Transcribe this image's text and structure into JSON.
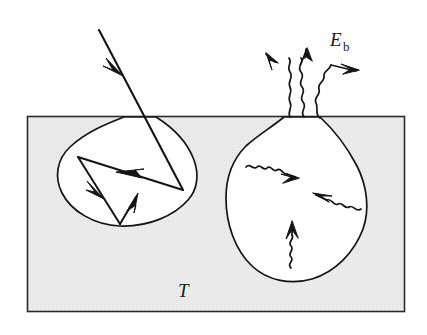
{
  "figure": {
    "type": "schematic-diagram",
    "canvas": {
      "width": 427,
      "height": 335,
      "background": "#ffffff"
    }
  },
  "labels": {
    "emissive_power": {
      "base": "E",
      "subscript": "b",
      "full": "E_b",
      "x": 330,
      "y": 44
    },
    "temperature": {
      "text": "T",
      "x": 182,
      "y": 293
    }
  },
  "colors": {
    "solid_fill": "#e9e9e9",
    "solid_fill_alt": "#efefef",
    "stroke": "#141414",
    "cavity_fill": "#ffffff",
    "border": "#2b2b2b",
    "text": "#1a1a1a"
  },
  "solid_block": {
    "name": "solid-material",
    "x": 27,
    "y": 116,
    "width": 378,
    "height": 196,
    "surface_y": 116
  },
  "left_cavity": {
    "name": "specular-reflection-cavity",
    "description": "Pit with multiple internal specular reflections of an incident ray",
    "opening_left_x": 124,
    "opening_right_x": 156,
    "max_depth_y": 226,
    "leftmost_x": 57,
    "rightmost_x": 196
  },
  "incident_ray": {
    "name": "incident-ray",
    "from": {
      "x": 99,
      "y": 30
    },
    "to": {
      "x": 183,
      "y": 190
    },
    "arrowhead_at": {
      "x": 118,
      "y": 67
    },
    "style": "straight-solid"
  },
  "reflected_rays": [
    {
      "name": "reflection-1",
      "from": {
        "x": 183,
        "y": 190
      },
      "to": {
        "x": 78,
        "y": 157
      },
      "arrow_t": 0.55
    },
    {
      "name": "reflection-2",
      "from": {
        "x": 78,
        "y": 157
      },
      "to": {
        "x": 120,
        "y": 224
      },
      "arrow_t": 0.52
    },
    {
      "name": "reflection-3",
      "from": {
        "x": 120,
        "y": 224
      },
      "to": {
        "x": 137,
        "y": 196
      },
      "arrow_t": 1.0
    }
  ],
  "right_cavity": {
    "name": "emission-cavity",
    "description": "Egg-shaped cavity with narrow neck emitting blackbody radiation",
    "neck_left_x": 284,
    "neck_right_x": 320,
    "neck_y": 116,
    "bottom_y": 281,
    "leftmost_x": 226,
    "rightmost_x": 366
  },
  "emitted_rays": [
    {
      "name": "emitted-ray-left",
      "tip": {
        "x": 266,
        "y": 54
      },
      "origin": {
        "x": 290,
        "y": 116
      },
      "direction": "up-left"
    },
    {
      "name": "emitted-ray-center",
      "tip": {
        "x": 307,
        "y": 50
      },
      "origin": {
        "x": 303,
        "y": 116
      },
      "direction": "up"
    },
    {
      "name": "emitted-ray-right",
      "tip": {
        "x": 358,
        "y": 70
      },
      "origin": {
        "x": 320,
        "y": 118
      },
      "direction": "up-right"
    }
  ],
  "internal_wavy_rays": [
    {
      "name": "internal-ray-upper-left",
      "from": {
        "x": 247,
        "y": 167
      },
      "to": {
        "x": 296,
        "y": 177
      },
      "direction": "right"
    },
    {
      "name": "internal-ray-right",
      "from": {
        "x": 361,
        "y": 209
      },
      "to": {
        "x": 315,
        "y": 194
      },
      "direction": "left"
    },
    {
      "name": "internal-ray-bottom",
      "from": {
        "x": 291,
        "y": 268
      },
      "to": {
        "x": 292,
        "y": 221
      },
      "direction": "up"
    }
  ]
}
